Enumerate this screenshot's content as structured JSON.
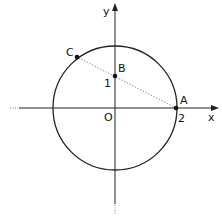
{
  "diagram": {
    "axes": {
      "x_label": "x",
      "y_label": "y",
      "origin_label": "O"
    },
    "circle": {
      "center": "O",
      "radius": 2
    },
    "points": [
      {
        "name": "A",
        "coords": [
          2,
          0
        ],
        "tick_label": "2"
      },
      {
        "name": "B",
        "coords": [
          0,
          1
        ],
        "tick_label": "1"
      },
      {
        "name": "C",
        "coords": [
          -1.2,
          1.6
        ]
      }
    ],
    "segment": {
      "from": "A",
      "to": "C",
      "through": "B",
      "style": "dotted"
    }
  }
}
